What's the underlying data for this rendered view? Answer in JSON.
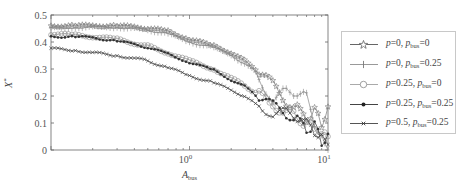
{
  "chart_data": {
    "type": "line",
    "title": "",
    "xlabel": "A_bus",
    "ylabel": "X*",
    "xscale": "log",
    "xlim": [
      0.1,
      10
    ],
    "ylim": [
      0,
      0.5
    ],
    "grid": false,
    "legend_position": "outside-right",
    "x_ticks": [
      {
        "value": 1,
        "label": "10^0"
      },
      {
        "value": 10,
        "label": "10^1"
      }
    ],
    "y_ticks": [
      {
        "value": 0,
        "label": "0"
      },
      {
        "value": 0.1,
        "label": "0.1"
      },
      {
        "value": 0.2,
        "label": "0.2"
      },
      {
        "value": 0.3,
        "label": "0.3"
      },
      {
        "value": 0.4,
        "label": "0.4"
      },
      {
        "value": 0.5,
        "label": "0.5"
      }
    ],
    "x": [
      0.1,
      0.15,
      0.2,
      0.3,
      0.4,
      0.5,
      0.7,
      1.0,
      1.5,
      2.0,
      2.5,
      3.0,
      4.0,
      5.0,
      6.0,
      7.0,
      8.0,
      9.0,
      10.0
    ],
    "series": [
      {
        "name": "p=0, p_bus=0",
        "marker": "star",
        "values": [
          0.46,
          0.46,
          0.46,
          0.46,
          0.455,
          0.45,
          0.44,
          0.41,
          0.385,
          0.36,
          0.33,
          0.3,
          0.24,
          0.18,
          0.15,
          0.12,
          0.14,
          0.1,
          0.16
        ]
      },
      {
        "name": "p=0, p_bus=0.25",
        "marker": "plus",
        "values": [
          0.45,
          0.455,
          0.455,
          0.455,
          0.45,
          0.445,
          0.43,
          0.4,
          0.38,
          0.35,
          0.32,
          0.29,
          0.18,
          0.22,
          0.21,
          0.2,
          0.1,
          0.04,
          0.0
        ]
      },
      {
        "name": "p=0.25, p_bus=0",
        "marker": "circle",
        "values": [
          0.43,
          0.425,
          0.42,
          0.41,
          0.395,
          0.385,
          0.36,
          0.33,
          0.3,
          0.265,
          0.24,
          0.21,
          0.17,
          0.14,
          0.12,
          0.1,
          0.08,
          0.06,
          0.05
        ]
      },
      {
        "name": "p=0.25, p_bus=0.25",
        "marker": "dot",
        "values": [
          0.42,
          0.42,
          0.415,
          0.405,
          0.39,
          0.38,
          0.355,
          0.325,
          0.295,
          0.26,
          0.235,
          0.205,
          0.165,
          0.135,
          0.11,
          0.08,
          0.09,
          0.03,
          0.06
        ]
      },
      {
        "name": "p=0.5, p_bus=0.25",
        "marker": "x",
        "values": [
          0.375,
          0.37,
          0.36,
          0.35,
          0.34,
          0.33,
          0.305,
          0.275,
          0.25,
          0.22,
          0.2,
          0.17,
          0.135,
          0.14,
          0.12,
          0.1,
          0.07,
          0.04,
          0.02
        ]
      }
    ]
  },
  "legend": {
    "items": [
      {
        "p": "0",
        "pbus": "0"
      },
      {
        "p": "0",
        "pbus": "0.25"
      },
      {
        "p": "0.25",
        "pbus": "0"
      },
      {
        "p": "0.25",
        "pbus": "0.25"
      },
      {
        "p": "0.5",
        "pbus": "0.25"
      }
    ],
    "p_symbol": "p",
    "pbus_symbol": "p",
    "pbus_sub": "bus"
  },
  "axes": {
    "ylabel_main": "X",
    "ylabel_sup": "*",
    "xlabel_main": "A",
    "xlabel_sub": "bus"
  },
  "colors": {
    "axis": "#666666",
    "series": [
      "#777777",
      "#888888",
      "#888888",
      "#333333",
      "#444444"
    ]
  }
}
